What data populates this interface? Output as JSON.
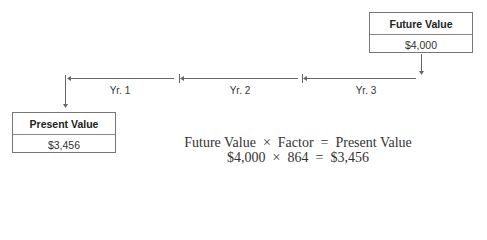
{
  "future_box": {
    "title": "Future Value",
    "value": "$4,000"
  },
  "present_box": {
    "title": "Present Value",
    "value": "$3,456"
  },
  "timeline": {
    "segments": [
      {
        "label": "Yr. 1"
      },
      {
        "label": "Yr. 2"
      },
      {
        "label": "Yr. 3"
      }
    ]
  },
  "formula": {
    "line1": "Future Value  ×  Factor  =  Present Value",
    "line2": "$4,000  ×  864  =  $3,456"
  }
}
